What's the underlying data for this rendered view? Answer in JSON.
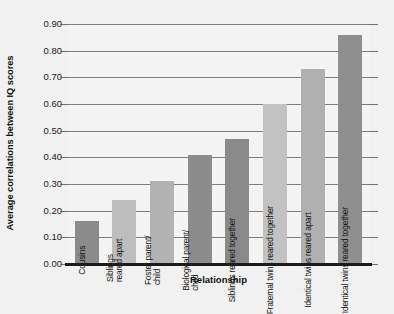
{
  "chart_data": {
    "type": "bar",
    "title": "",
    "xlabel": "Relationship",
    "ylabel": "Average correlations between IQ scores",
    "ylim": [
      0.0,
      0.9
    ],
    "ytick_labels": [
      "0.90",
      "0.80",
      "0.70",
      "0.60",
      "0.50",
      "0.40",
      "0.30",
      "0.20",
      "0.10",
      "0.00"
    ],
    "ytick_values": [
      0.9,
      0.8,
      0.7,
      0.6,
      0.5,
      0.4,
      0.3,
      0.2,
      0.1,
      0.0
    ],
    "grid": true,
    "legend": "none",
    "categories": [
      "Cousins",
      "Siblings reared apart",
      "Foster parent/ child",
      "Biological parent/ child",
      "Siblings reared together",
      "Fraternal twins reared together",
      "Identical twins reared apart",
      "Identical twins reared together"
    ],
    "category_lines": [
      [
        "Cousins"
      ],
      [
        "Siblings",
        "reared apart"
      ],
      [
        "Foster parent/",
        "child"
      ],
      [
        "Biological parent/",
        "child"
      ],
      [
        "Siblings reared together"
      ],
      [
        "Fraternal twins reared together"
      ],
      [
        "Identical twins reared apart"
      ],
      [
        "Identical twins reared together"
      ]
    ],
    "values": [
      0.16,
      0.24,
      0.31,
      0.41,
      0.47,
      0.6,
      0.73,
      0.86
    ],
    "bar_colors": [
      "#8b8b8b",
      "#bdbdbd",
      "#b3b3b3",
      "#8c8c8c",
      "#8a8a8a",
      "#c2c2c2",
      "#b0b0b0",
      "#8f8f8f"
    ]
  },
  "axis": {
    "y_title": "Average correlations between IQ scores",
    "x_title": "Relationship"
  },
  "colors": {
    "background": "#f1f1f1",
    "plot_background": "#f4f4f4",
    "gridline": "#7d7d7d",
    "baseline": "#1c1c1c",
    "text": "#141414"
  }
}
